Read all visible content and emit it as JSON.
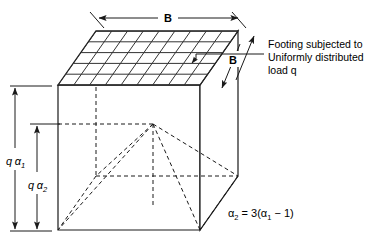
{
  "figure": {
    "title_alt": "Pressure bulb / footing load distribution diagram",
    "colors": {
      "stroke": "#1a1a1a",
      "background": "#ffffff",
      "grid": "#333333"
    },
    "labels": {
      "top_width": "B",
      "side_width": "B",
      "dim_outer": "q",
      "dim_outer_symbol": "α",
      "dim_outer_sub": "1",
      "dim_inner": "q",
      "dim_inner_symbol": "α",
      "dim_inner_sub": "2",
      "equation_lhs_symbol": "α",
      "equation_lhs_sub": "2",
      "equation_mid": " = 3(",
      "equation_rhs_symbol": "α",
      "equation_rhs_sub": "1",
      "equation_tail": " − 1)",
      "note_line_1": "Footing subjected to",
      "note_line_2": "Uniformly distributed",
      "note_line_3": "load q"
    },
    "geometry": {
      "top_face_grid_cols": 9,
      "top_face_grid_rows": 5,
      "front_top_left": [
        58,
        85
      ],
      "front_top_right": [
        200,
        85
      ],
      "back_top_left": [
        96,
        31
      ],
      "back_top_right": [
        238,
        31
      ],
      "front_bottom_left": [
        58,
        230
      ],
      "front_bottom_right": [
        200,
        230
      ],
      "back_bottom_right": [
        238,
        176
      ],
      "pyramid_apex": [
        153,
        124
      ]
    }
  }
}
